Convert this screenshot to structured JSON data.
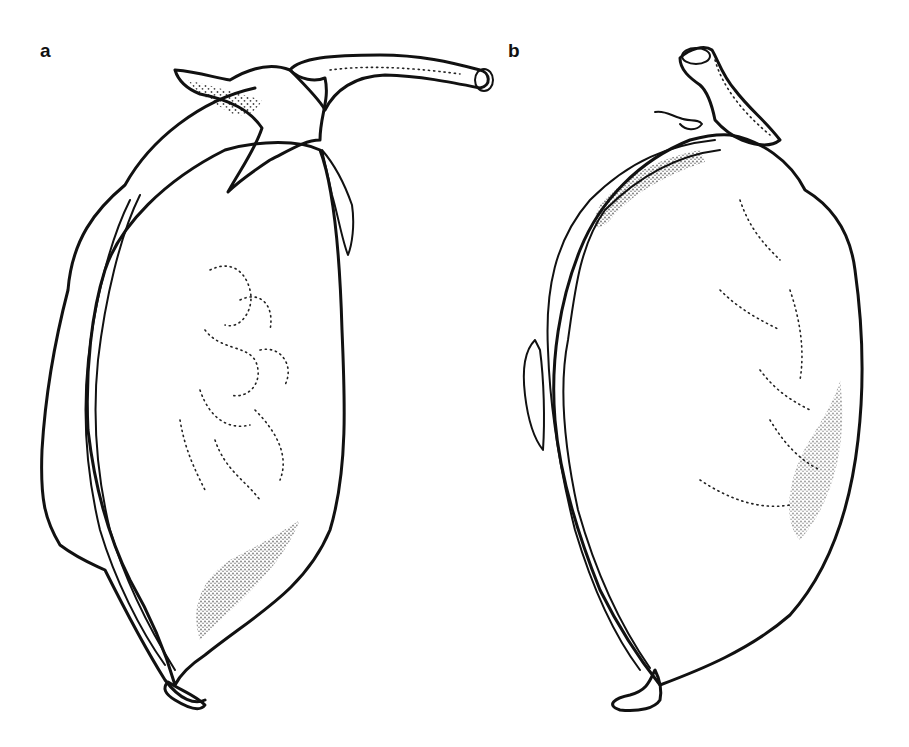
{
  "figure": {
    "panels": [
      {
        "label": "a",
        "subject": "pod with calyx and curved pedicel (stalk) at top, beak at bottom"
      },
      {
        "label": "b",
        "subject": "pod with short broken pedicel at top, beak at bottom"
      }
    ],
    "colors": {
      "ink": "#111111",
      "background": "#ffffff"
    }
  }
}
